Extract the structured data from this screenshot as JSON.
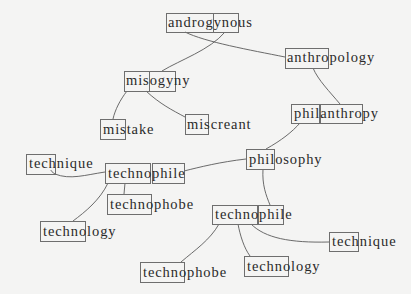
{
  "diagram": {
    "type": "morpheme-word-tree",
    "background": "#f4f4f3",
    "line_color": "#5a5a5a",
    "box_color": "#6e6e6e",
    "text_color": "#2a2a2a",
    "nodes": [
      {
        "id": "androgynous",
        "text": "androgynous",
        "x": 168,
        "y": 27,
        "boxes": [
          [
            166,
            13,
            47,
            19
          ],
          [
            213,
            13,
            25,
            19
          ]
        ],
        "boxed_parts": [
          "andro",
          "gyn"
        ]
      },
      {
        "id": "anthropology",
        "text": "anthropology",
        "x": 287,
        "y": 62,
        "boxes": [
          [
            285,
            48,
            43,
            20
          ]
        ],
        "boxed_parts": [
          "anthro"
        ]
      },
      {
        "id": "misogyny",
        "text": "misogyny",
        "x": 126,
        "y": 85,
        "boxes": [
          [
            124,
            71,
            25,
            20
          ],
          [
            149,
            71,
            26,
            20
          ]
        ],
        "boxed_parts": [
          "miso",
          "gyn"
        ]
      },
      {
        "id": "philanthropy",
        "text": "philanthropy",
        "x": 294,
        "y": 118,
        "boxes": [
          [
            291,
            104,
            28,
            19
          ],
          [
            320,
            104,
            42,
            19
          ]
        ],
        "boxed_parts": [
          "phil",
          "anthro"
        ]
      },
      {
        "id": "mistake",
        "text": "mistake",
        "x": 103,
        "y": 134,
        "boxes": [
          [
            100,
            119,
            25,
            20
          ]
        ],
        "boxed_parts": [
          "mis"
        ]
      },
      {
        "id": "miscreant",
        "text": "miscreant",
        "x": 187,
        "y": 129,
        "boxes": [
          [
            185,
            114,
            23,
            20
          ]
        ],
        "boxed_parts": [
          "mis"
        ]
      },
      {
        "id": "philosophy",
        "text": "philosophy",
        "x": 249,
        "y": 164,
        "boxes": [
          [
            246,
            149,
            28,
            20
          ]
        ],
        "boxed_parts": [
          "phil"
        ]
      },
      {
        "id": "technique-left",
        "text": "technique",
        "x": 29,
        "y": 168,
        "boxes": [
          [
            26,
            154,
            29,
            20
          ]
        ],
        "boxed_parts": [
          "tech"
        ]
      },
      {
        "id": "technophile-mid",
        "text": "technophile",
        "x": 108,
        "y": 178,
        "boxes": [
          [
            105,
            163,
            45,
            20
          ],
          [
            152,
            163,
            32,
            20
          ]
        ],
        "boxed_parts": [
          "techno",
          "phile"
        ]
      },
      {
        "id": "technophobe-mid",
        "text": "technophobe",
        "x": 110,
        "y": 209,
        "boxes": [
          [
            107,
            194,
            44,
            20
          ]
        ],
        "boxed_parts": [
          "techno"
        ]
      },
      {
        "id": "technology-left",
        "text": "technology",
        "x": 43,
        "y": 236,
        "boxes": [
          [
            40,
            221,
            45,
            20
          ]
        ],
        "boxed_parts": [
          "techno"
        ]
      },
      {
        "id": "technophile-low",
        "text": "technophile",
        "x": 215,
        "y": 219,
        "boxes": [
          [
            212,
            205,
            45,
            19
          ],
          [
            258,
            205,
            25,
            19
          ]
        ],
        "boxed_parts": [
          "techno",
          "phil"
        ]
      },
      {
        "id": "technique-right",
        "text": "technique",
        "x": 332,
        "y": 246,
        "boxes": [
          [
            329,
            232,
            29,
            19
          ]
        ],
        "boxed_parts": [
          "tech"
        ]
      },
      {
        "id": "technophobe-bottom",
        "text": "technophobe",
        "x": 143,
        "y": 277,
        "boxes": [
          [
            140,
            262,
            44,
            20
          ]
        ],
        "boxed_parts": [
          "techno"
        ]
      },
      {
        "id": "technology-bottom",
        "text": "technology",
        "x": 247,
        "y": 271,
        "boxes": [
          [
            244,
            256,
            44,
            20
          ]
        ],
        "boxed_parts": [
          "techno"
        ]
      }
    ],
    "edges": [
      {
        "from": "androgynous",
        "to": "anthropology",
        "d": "M185,32 C205,42 250,50 285,57"
      },
      {
        "from": "androgynous",
        "to": "misogyny",
        "d": "M225,32 C210,50 180,60 162,71"
      },
      {
        "from": "anthropology",
        "to": "philanthropy",
        "d": "M313,68 C318,80 330,92 340,104"
      },
      {
        "from": "misogyny",
        "to": "mistake",
        "d": "M127,91 C120,100 115,110 113,119"
      },
      {
        "from": "misogyny",
        "to": "miscreant",
        "d": "M146,91 C160,104 172,110 185,117"
      },
      {
        "from": "philanthropy",
        "to": "philosophy",
        "d": "M300,123 C292,132 282,140 266,149"
      },
      {
        "from": "philosophy",
        "to": "technophile-mid",
        "d": "M246,159 C220,162 200,167 184,171"
      },
      {
        "from": "technophile-mid",
        "to": "technique-left",
        "d": "M105,172 C85,175 70,180 55,174 C52,172 51,171 51,170"
      },
      {
        "from": "technophile-mid",
        "to": "technophobe-mid",
        "d": "M125,183 L124,194"
      },
      {
        "from": "technophile-mid",
        "to": "technology-left",
        "d": "M108,183 C100,200 85,212 73,221"
      },
      {
        "from": "philosophy",
        "to": "technophile-low",
        "d": "M263,169 C262,185 266,195 270,205"
      },
      {
        "from": "technophile-low",
        "to": "technophobe-bottom",
        "d": "M219,224 C210,240 195,250 181,262"
      },
      {
        "from": "technophile-low",
        "to": "technology-bottom",
        "d": "M238,224 C240,235 244,248 250,256"
      },
      {
        "from": "technophile-low",
        "to": "technique-right",
        "d": "M251,224 C265,238 290,243 329,242"
      }
    ]
  }
}
